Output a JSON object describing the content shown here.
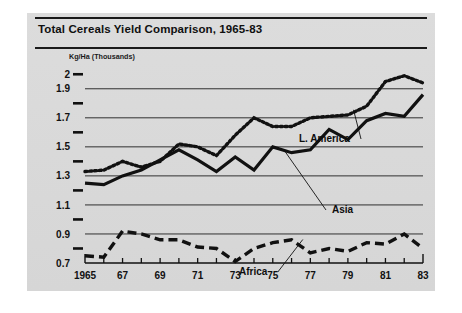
{
  "figure": {
    "title": "Total Cereals Yield Comparison, 1965-83",
    "panel_color": "#d9d9d9",
    "ink_color": "#111111"
  },
  "axes": {
    "y_caption": "Kg/Ha (Thousands)",
    "y_major_labels": [
      "2",
      "1.9",
      "1.7",
      "1.5",
      "1.3",
      "1.1",
      "0.9",
      "0.7"
    ],
    "y_major_values": [
      2,
      1.9,
      1.7,
      1.5,
      1.3,
      1.1,
      0.9,
      0.7
    ],
    "y_minor_values": [
      1.8,
      1.6,
      1.4,
      1.2,
      1.0,
      0.8
    ],
    "y_gridline_values": [
      1.9,
      1.7,
      1.5,
      1.3,
      1.1,
      0.9
    ],
    "ylim": [
      0.7,
      2.05
    ],
    "x_labels": [
      "1965",
      "67",
      "69",
      "71",
      "73",
      "75",
      "77",
      "79",
      "81",
      "83"
    ],
    "x_label_values": [
      1965,
      1967,
      1969,
      1971,
      1973,
      1975,
      1977,
      1979,
      1981,
      1983
    ],
    "x_minor_values": [
      1966,
      1968,
      1970,
      1972,
      1974,
      1976,
      1978,
      1980,
      1982
    ],
    "xlim": [
      1965,
      1983
    ]
  },
  "annotations": [
    {
      "id": "l-america",
      "text": "L. America",
      "x": 272,
      "y": 93
    },
    {
      "id": "asia",
      "text": "Asia",
      "x": 305,
      "y": 164
    },
    {
      "id": "africa",
      "text": "Africa",
      "x": 212,
      "y": 226
    }
  ],
  "chart_data": {
    "type": "line",
    "title": "Total Cereals Yield Comparison, 1965-83",
    "xlabel": "",
    "ylabel": "Kg/Ha (Thousands)",
    "xlim": [
      1965,
      1983
    ],
    "ylim": [
      0.7,
      2.05
    ],
    "grid": true,
    "legend_position": "inline-annotation",
    "x": [
      1965,
      1966,
      1967,
      1968,
      1969,
      1970,
      1971,
      1972,
      1973,
      1974,
      1975,
      1976,
      1977,
      1978,
      1979,
      1980,
      1981,
      1982,
      1983
    ],
    "series": [
      {
        "name": "L. America",
        "style": "dotted",
        "color": "#111111",
        "values": [
          1.33,
          1.34,
          1.4,
          1.36,
          1.4,
          1.52,
          1.5,
          1.44,
          1.58,
          1.7,
          1.64,
          1.64,
          1.7,
          1.71,
          1.72,
          1.78,
          1.95,
          1.99,
          1.94
        ]
      },
      {
        "name": "Asia",
        "style": "solid",
        "color": "#111111",
        "values": [
          1.25,
          1.24,
          1.3,
          1.34,
          1.41,
          1.48,
          1.41,
          1.33,
          1.43,
          1.34,
          1.5,
          1.46,
          1.48,
          1.62,
          1.55,
          1.68,
          1.73,
          1.71,
          1.86
        ]
      },
      {
        "name": "Africa",
        "style": "dashed",
        "color": "#111111",
        "values": [
          0.75,
          0.74,
          0.92,
          0.9,
          0.86,
          0.86,
          0.81,
          0.8,
          0.71,
          0.8,
          0.84,
          0.86,
          0.77,
          0.8,
          0.78,
          0.84,
          0.83,
          0.9,
          0.8
        ]
      }
    ]
  }
}
